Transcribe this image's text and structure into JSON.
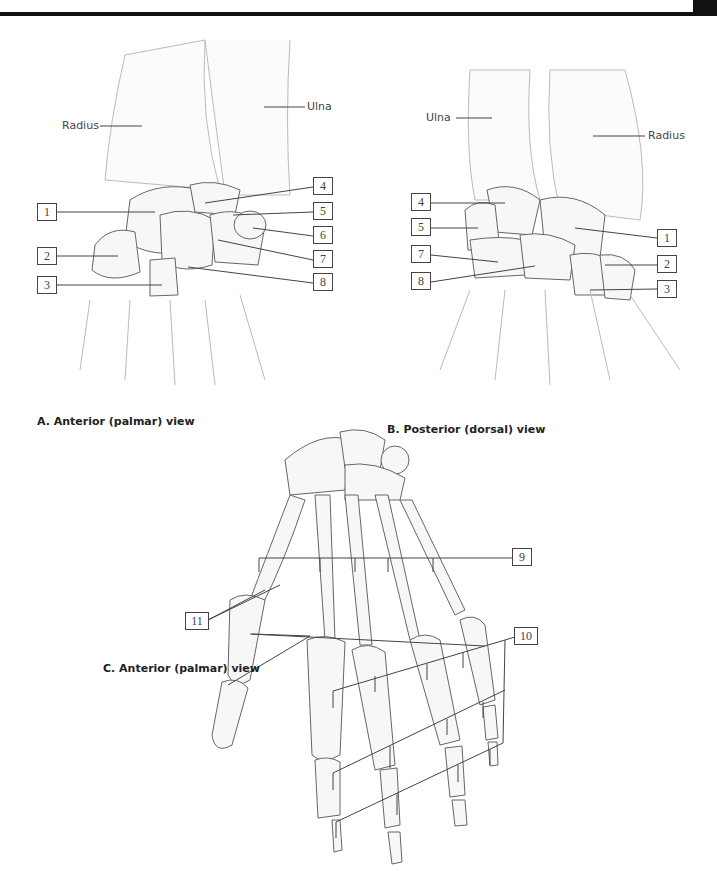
{
  "figure": {
    "panels": [
      {
        "id": "A",
        "caption": "A. Anterior (palmar) view",
        "bone_labels": {
          "radius": "Radius",
          "ulna": "Ulna"
        },
        "numbered_labels": [
          "1",
          "2",
          "3",
          "4",
          "5",
          "6",
          "7",
          "8"
        ]
      },
      {
        "id": "B",
        "caption": "B. Posterior (dorsal) view",
        "bone_labels": {
          "ulna": "Ulna",
          "radius": "Radius"
        },
        "numbered_labels": [
          "4",
          "5",
          "7",
          "8",
          "1",
          "2",
          "3"
        ]
      },
      {
        "id": "C",
        "caption": "C. Anterior (palmar) view",
        "numbered_labels": [
          "9",
          "10",
          "11"
        ]
      }
    ],
    "colors": {
      "line": "#444444",
      "bone_fill": "#f7f7f7",
      "bone_stroke": "#555555",
      "bar": "#111111"
    }
  }
}
